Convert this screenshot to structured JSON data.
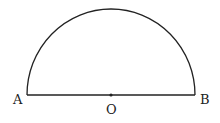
{
  "diagram": {
    "type": "semicircle",
    "labels": {
      "left_endpoint": "A",
      "center": "O",
      "right_endpoint": "B"
    },
    "colors": {
      "stroke": "#222222",
      "background": "#ffffff"
    }
  }
}
